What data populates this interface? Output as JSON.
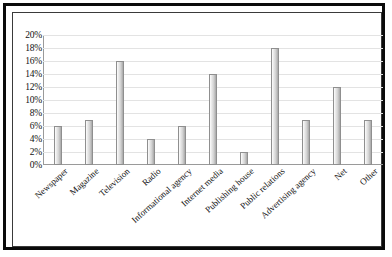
{
  "chart_data": {
    "type": "bar",
    "title": "",
    "subtitle": "",
    "xlabel": "",
    "ylabel": "",
    "ylim": [
      0,
      20
    ],
    "ytick_labels": [
      "20%",
      "18%",
      "16%",
      "14%",
      "12%",
      "10%",
      "8%",
      "6%",
      "4%",
      "2%",
      "0%"
    ],
    "ytick_values": [
      20,
      18,
      16,
      14,
      12,
      10,
      8,
      6,
      4,
      2,
      0
    ],
    "grid": true,
    "legend": "none",
    "value_suffix": "%",
    "categories": [
      "Newspaper",
      "Magazine",
      "Television",
      "Radio",
      "Informational agency",
      "Internet media",
      "Publishing house",
      "Public relations",
      "Advertising agency",
      "Net",
      "Other"
    ],
    "values": [
      6,
      7,
      16,
      4,
      6,
      14,
      2,
      18,
      7,
      12,
      7
    ],
    "colors": {
      "bar_fill_light": "#fdfdfd",
      "bar_fill_dark": "#a8a8a8",
      "bar_border": "#8f8f8f",
      "gridline": "#e3e3e3",
      "axis": "#9a9a9a",
      "outer_frame": "#0a0a0a",
      "inner_frame": "#3a3a3a",
      "text": "#111111",
      "background": "#ffffff"
    }
  }
}
